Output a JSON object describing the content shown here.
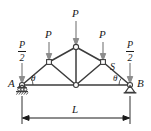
{
  "figure": {
    "type": "engineering-statics-diagram",
    "colors": {
      "member": "#3c3c3c",
      "load_arrow": "#8c8c8c",
      "text": "#1a1a1a",
      "joint_fill": "#ffffff",
      "dimension": "#1a1a1a",
      "background": "#ffffff"
    }
  },
  "labels": {
    "support_left": "A",
    "support_right": "B",
    "member_right_diagonal": "S",
    "span_dimension": "L",
    "angle_left": "θ",
    "angle_right": "θ",
    "load_full": "P",
    "load_half_numerator": "P",
    "load_half_denominator": "2"
  },
  "loads": [
    {
      "id": "load-left-half",
      "label": "P/2",
      "numerator": "P",
      "denominator": "2",
      "x": 22,
      "applied_at": "joint-A"
    },
    {
      "id": "load-left-full",
      "label": "P",
      "x": 49,
      "applied_at": "joint-upper-left"
    },
    {
      "id": "load-apex",
      "label": "P",
      "x": 76,
      "applied_at": "joint-apex"
    },
    {
      "id": "load-right-full",
      "label": "P",
      "x": 103,
      "applied_at": "joint-upper-right"
    },
    {
      "id": "load-right-half",
      "label": "P/2",
      "numerator": "P",
      "denominator": "2",
      "x": 130,
      "applied_at": "joint-B"
    }
  ],
  "joints": [
    {
      "id": "joint-A",
      "x": 22,
      "y": 85,
      "shape": "circle"
    },
    {
      "id": "joint-upper-left",
      "x": 49,
      "y": 62,
      "shape": "square"
    },
    {
      "id": "joint-apex",
      "x": 76,
      "y": 47,
      "shape": "circle"
    },
    {
      "id": "joint-upper-right",
      "x": 103,
      "y": 62,
      "shape": "square"
    },
    {
      "id": "joint-B",
      "x": 130,
      "y": 85,
      "shape": "circle"
    },
    {
      "id": "joint-center",
      "x": 76,
      "y": 85,
      "shape": "circle"
    }
  ],
  "members": [
    {
      "id": "bottom-chord-left",
      "from": "joint-A",
      "to": "joint-center"
    },
    {
      "id": "bottom-chord-right",
      "from": "joint-center",
      "to": "joint-B"
    },
    {
      "id": "top-chord-left-lower",
      "from": "joint-A",
      "to": "joint-upper-left"
    },
    {
      "id": "top-chord-left-upper",
      "from": "joint-upper-left",
      "to": "joint-apex"
    },
    {
      "id": "top-chord-right-upper",
      "from": "joint-apex",
      "to": "joint-upper-right"
    },
    {
      "id": "top-chord-right-lower",
      "from": "joint-upper-right",
      "to": "joint-B"
    },
    {
      "id": "vertical-center-post",
      "from": "joint-apex",
      "to": "joint-center"
    },
    {
      "id": "diagonal-left",
      "from": "joint-upper-left",
      "to": "joint-center"
    },
    {
      "id": "diagonal-right",
      "from": "joint-upper-right",
      "to": "joint-center"
    }
  ],
  "supports": {
    "left": {
      "type": "roller-on-hatched-ground",
      "at": "joint-A"
    },
    "right": {
      "type": "pin-triangle",
      "at": "joint-B"
    }
  },
  "dimension": {
    "label": "L",
    "from_x": 22,
    "to_x": 130,
    "y": 118
  }
}
